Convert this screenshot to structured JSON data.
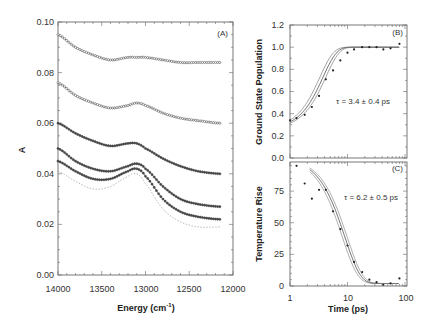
{
  "chart_data": [
    {
      "type": "line",
      "panel_label": "(A)",
      "xlabel": "Energy (cm⁻¹)",
      "ylabel": "A",
      "xlim": [
        14000,
        12000
      ],
      "ylim": [
        0.0,
        0.1
      ],
      "x_ticks": [
        "14000",
        "13500",
        "13000",
        "12500",
        "12000"
      ],
      "y_ticks": [
        "0.00",
        "0.02",
        "0.04",
        "0.06",
        "0.08",
        "0.10"
      ],
      "x": [
        14000,
        13800,
        13600,
        13400,
        13200,
        13100,
        13000,
        12800,
        12600,
        12400,
        12150
      ],
      "series": [
        {
          "name": "spectrum 1",
          "style": "open-markers",
          "values": [
            0.095,
            0.09,
            0.087,
            0.085,
            0.086,
            0.086,
            0.086,
            0.085,
            0.084,
            0.084,
            0.084
          ]
        },
        {
          "name": "spectrum 2",
          "style": "open-markers",
          "values": [
            0.076,
            0.071,
            0.068,
            0.066,
            0.067,
            0.068,
            0.067,
            0.064,
            0.062,
            0.061,
            0.06
          ]
        },
        {
          "name": "spectrum 3",
          "style": "filled-markers",
          "values": [
            0.06,
            0.056,
            0.053,
            0.051,
            0.052,
            0.052,
            0.05,
            0.046,
            0.043,
            0.041,
            0.04
          ]
        },
        {
          "name": "spectrum 4",
          "style": "filled-markers",
          "values": [
            0.05,
            0.045,
            0.042,
            0.041,
            0.043,
            0.044,
            0.042,
            0.035,
            0.03,
            0.028,
            0.027
          ]
        },
        {
          "name": "spectrum 5",
          "style": "filled-markers",
          "values": [
            0.045,
            0.041,
            0.038,
            0.038,
            0.041,
            0.042,
            0.039,
            0.03,
            0.025,
            0.023,
            0.022
          ]
        },
        {
          "name": "spectrum 6",
          "style": "dotted",
          "values": [
            0.041,
            0.037,
            0.034,
            0.035,
            0.039,
            0.04,
            0.036,
            0.026,
            0.021,
            0.019,
            0.019
          ]
        }
      ]
    },
    {
      "type": "scatter",
      "panel_label": "(B)",
      "xlabel": "",
      "ylabel": "Ground State Population",
      "xscale": "log",
      "xlim": [
        1,
        100
      ],
      "ylim": [
        0.0,
        1.2
      ],
      "y_ticks": [
        "0.0",
        "0.2",
        "0.4",
        "0.6",
        "0.8",
        "1.0",
        "1.2"
      ],
      "annotation": "τ = 3.4 ± 0.4 ps",
      "points_x": [
        1.0,
        1.3,
        1.8,
        2.4,
        3.2,
        4.2,
        5.6,
        7.5,
        10,
        13,
        18,
        24,
        32,
        42,
        56,
        80
      ],
      "points_y": [
        0.34,
        0.36,
        0.39,
        0.46,
        0.56,
        0.71,
        0.79,
        0.88,
        0.95,
        0.98,
        1.0,
        1.0,
        1.0,
        0.98,
        0.99,
        1.03
      ],
      "fit_curves": 3
    },
    {
      "type": "scatter",
      "panel_label": "(C)",
      "xlabel": "Time (ps)",
      "ylabel": "Temperature Rise",
      "xscale": "log",
      "xlim": [
        1,
        100
      ],
      "ylim": [
        0,
        98
      ],
      "x_ticks": [
        "1",
        "10",
        "100"
      ],
      "y_ticks": [
        "0",
        "25",
        "50",
        "75"
      ],
      "annotation": "τ = 6.2 ± 0.5 ps",
      "points_x": [
        1.3,
        1.8,
        2.4,
        3.2,
        4.2,
        5.6,
        7.5,
        10,
        13,
        18,
        24,
        32,
        42,
        56,
        80
      ],
      "points_y": [
        95,
        81,
        69,
        76,
        76,
        59,
        45,
        32,
        19,
        11,
        5,
        3,
        1,
        2,
        6
      ],
      "fit_curves": 3
    }
  ],
  "panels": {
    "a": {
      "label": "(A)",
      "xlabel": "Energy (cm",
      "xlabel_sup": "-1",
      "xlabel_end": ")",
      "ylabel": "A",
      "xt": [
        "14000",
        "13500",
        "13000",
        "12500",
        "12000"
      ],
      "yt": [
        "0.00",
        "0.02",
        "0.04",
        "0.06",
        "0.08",
        "0.10"
      ]
    },
    "b": {
      "label": "(B)",
      "ylabel": "Ground State Population",
      "annotation": "τ = 3.4 ± 0.4 ps",
      "yt": [
        "0.0",
        "0.2",
        "0.4",
        "0.6",
        "0.8",
        "1.0",
        "1.2"
      ]
    },
    "c": {
      "label": "(C)",
      "ylabel": "Temperature Rise",
      "xlabel": "Time (ps)",
      "annotation": "τ = 6.2 ± 0.5 ps",
      "yt": [
        "0",
        "25",
        "50",
        "75"
      ],
      "xt": [
        "1",
        "10",
        "100"
      ]
    }
  }
}
